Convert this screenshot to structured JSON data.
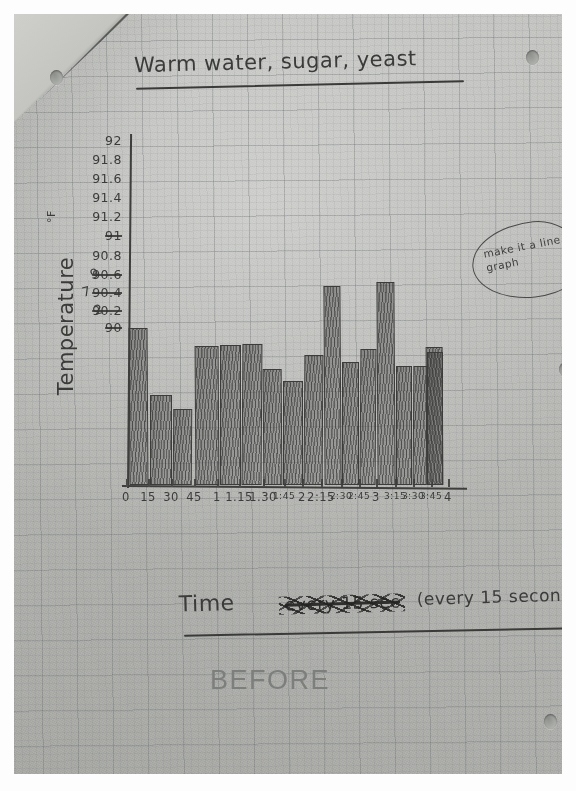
{
  "document": {
    "title": "Warm water, sugar, yeast",
    "printed_caption": "BEFORE",
    "teacher_note": "make it a line graph",
    "paper": "graph paper, photographed, folded top-left corner, 3-hole punched"
  },
  "axes": {
    "y_label": "Temperature",
    "y_unit": "°F",
    "x_label_main": "Time",
    "x_label_struck": "every 15 sec",
    "x_label_paren": "(every 15 second"
  },
  "chart_data": {
    "type": "bar",
    "title": "Warm water, sugar, yeast",
    "xlabel": "Time (every 15 second",
    "ylabel": "Temperature °F",
    "ylim": [
      90,
      92
    ],
    "grid": true,
    "legend": "none",
    "y_ticks": [
      "92",
      "91.8",
      "91.6",
      "91.4",
      "91.2",
      "91",
      "90.8",
      "90.6",
      "90.4",
      "90.2",
      "90"
    ],
    "y_ticks_messy": [
      "91",
      "90.6",
      "90.4",
      "90.2",
      "90"
    ],
    "categories": [
      "0",
      "15",
      "30",
      "45",
      "1",
      "1:15",
      "1:30",
      "1:45",
      "2",
      "2:15",
      "2:30",
      "2:45",
      "3",
      "3:15",
      "3:30",
      "3:45",
      "4"
    ],
    "x_tick_labels": [
      "0",
      "15",
      "30",
      "45",
      "1",
      "1.15",
      "1.30",
      "1:45",
      "2",
      "2:15",
      "2:30",
      "2:45",
      "3",
      "3:15",
      "3:30",
      "3:45",
      "4"
    ],
    "values": [
      91.6,
      90.9,
      90.75,
      91.4,
      91.4,
      91.4,
      91.15,
      91.05,
      91.3,
      91.85,
      91.25,
      91.35,
      91.9,
      91.2,
      91.2,
      91.4,
      91.35
    ],
    "units": "degrees Fahrenheit",
    "note": "hand-drawn pencil bar graph; bars shaded with vertical hatching"
  },
  "bars": [
    {
      "label": "0",
      "x": 115,
      "w": 19,
      "top": 314
    },
    {
      "label": "15",
      "x": 136,
      "w": 22,
      "top": 381
    },
    {
      "label": "30",
      "x": 159,
      "w": 19,
      "top": 395
    },
    {
      "label": "45",
      "x": 181,
      "w": 24,
      "top": 332
    },
    {
      "label": "1",
      "x": 206,
      "w": 21,
      "top": 331
    },
    {
      "label": "1:15",
      "x": 228,
      "w": 20,
      "top": 330
    },
    {
      "label": "1:30",
      "x": 249,
      "w": 19,
      "top": 355
    },
    {
      "label": "1:45",
      "x": 269,
      "w": 20,
      "top": 367
    },
    {
      "label": "2",
      "x": 290,
      "w": 19,
      "top": 341
    },
    {
      "label": "2:15",
      "x": 310,
      "w": 17,
      "top": 272
    },
    {
      "label": "2:30",
      "x": 328,
      "w": 17,
      "top": 348
    },
    {
      "label": "2:45",
      "x": 346,
      "w": 16,
      "top": 335
    },
    {
      "label": "3",
      "x": 363,
      "w": 18,
      "top": 268
    },
    {
      "label": "3:15",
      "x": 382,
      "w": 16,
      "top": 352
    },
    {
      "label": "3:30",
      "x": 399,
      "w": 14,
      "top": 352
    },
    {
      "label": "3:45",
      "x": 412,
      "w": 17,
      "top": 333
    },
    {
      "label": "4",
      "x": 413,
      "w": 16,
      "top": 338
    }
  ],
  "y_tick_positions": [
    {
      "label": "92",
      "y": 271,
      "messy": false
    },
    {
      "label": "91.8",
      "y": 290,
      "messy": false
    },
    {
      "label": "91.6",
      "y": 309,
      "messy": false
    },
    {
      "label": "91.4",
      "y": 328,
      "messy": false
    },
    {
      "label": "91.2",
      "y": 347,
      "messy": false
    },
    {
      "label": "91",
      "y": 366,
      "messy": true
    },
    {
      "label": "90.8",
      "y": 386,
      "messy": false
    },
    {
      "label": "90.6",
      "y": 405,
      "messy": true
    },
    {
      "label": "90.4",
      "y": 423,
      "messy": true
    },
    {
      "label": "90.2",
      "y": 441,
      "messy": true
    },
    {
      "label": "90",
      "y": 458,
      "messy": true
    }
  ],
  "x_tick_positions": [
    {
      "label": "0",
      "x": 112,
      "small": false
    },
    {
      "label": "15",
      "x": 134,
      "small": false
    },
    {
      "label": "30",
      "x": 157,
      "small": false
    },
    {
      "label": "45",
      "x": 180,
      "small": false
    },
    {
      "label": "1",
      "x": 203,
      "small": false
    },
    {
      "label": "1.15",
      "x": 225,
      "small": false
    },
    {
      "label": "1.30",
      "x": 249,
      "small": false
    },
    {
      "label": "1:45",
      "x": 270,
      "small": true
    },
    {
      "label": "2",
      "x": 288,
      "small": false
    },
    {
      "label": "2:15",
      "x": 307,
      "small": false
    },
    {
      "label": "2:30",
      "x": 327,
      "small": true
    },
    {
      "label": "2:45",
      "x": 345,
      "small": true
    },
    {
      "label": "3",
      "x": 362,
      "small": false
    },
    {
      "label": "3:15",
      "x": 381,
      "small": true
    },
    {
      "label": "3:30",
      "x": 399,
      "small": true
    },
    {
      "label": "3:45",
      "x": 417,
      "small": true
    },
    {
      "label": "4",
      "x": 434,
      "small": false
    }
  ],
  "holes": [
    {
      "x": 36,
      "y": 56
    },
    {
      "x": 512,
      "y": 36
    },
    {
      "x": 545,
      "y": 348
    },
    {
      "x": 530,
      "y": 700
    }
  ]
}
